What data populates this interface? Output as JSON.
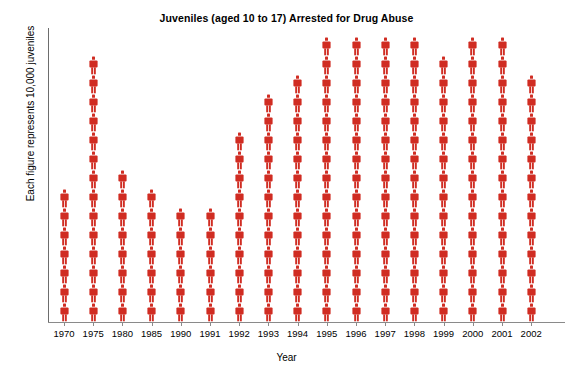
{
  "chart_data": {
    "type": "bar",
    "subtype": "pictogram",
    "title": "Juveniles (aged 10 to 17) Arrested for Drug Abuse",
    "xlabel": "Year",
    "ylabel": "Each figure represents 10,000 juveniles",
    "unit_per_figure": 10000,
    "icon": "person-figure-icon",
    "series_color": "#d02c22",
    "grid": false,
    "legend": "none",
    "categories": [
      "1970",
      "1975",
      "1980",
      "1985",
      "1990",
      "1991",
      "1992",
      "1993",
      "1994",
      "1995",
      "1996",
      "1997",
      "1998",
      "1999",
      "2000",
      "2001",
      "2002"
    ],
    "figure_counts": [
      7,
      14,
      8,
      7,
      6,
      6,
      10,
      12,
      13,
      15,
      15,
      15,
      15,
      14,
      15,
      15,
      13
    ],
    "values": [
      70000,
      140000,
      80000,
      70000,
      60000,
      60000,
      100000,
      120000,
      130000,
      150000,
      150000,
      150000,
      150000,
      140000,
      150000,
      150000,
      130000
    ],
    "ylim": [
      0,
      150000
    ]
  },
  "axes": {
    "x_label": "Year",
    "y_label": "Each figure represents 10,000 juveniles"
  }
}
